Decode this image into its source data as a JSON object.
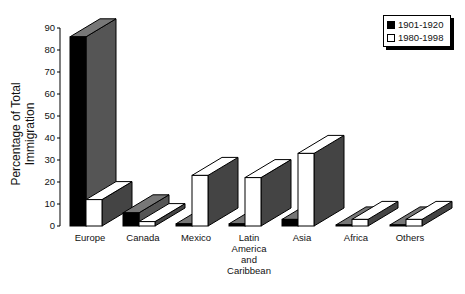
{
  "chart_data": {
    "type": "bar",
    "title": "",
    "xlabel": "",
    "ylabel": "Percentage of Total Immigration",
    "ylim": [
      0,
      90
    ],
    "yticks": [
      0,
      10,
      20,
      30,
      40,
      50,
      60,
      70,
      80,
      90
    ],
    "grid": false,
    "legend_position": "top-right",
    "style": "3d",
    "categories": [
      "Europe",
      "Canada",
      "Mexico",
      "Latin America and Caribbean",
      "Asia",
      "Africa",
      "Others"
    ],
    "series": [
      {
        "name": "1901-1920",
        "color": "#000000",
        "values": [
          86,
          6,
          1,
          1,
          3,
          0.5,
          0.5
        ]
      },
      {
        "name": "1980-1998",
        "color": "#ffffff",
        "values": [
          12,
          2,
          23,
          22,
          33,
          3,
          3
        ]
      }
    ]
  },
  "labels": {
    "ylabel": "Percentage of Total Immigration",
    "legend": [
      "1901-1920",
      "1980-1998"
    ],
    "categories": [
      "Europe",
      "Canada",
      "Mexico",
      "Latin\nAmerica\nand\nCaribbean",
      "Asia",
      "Africa",
      "Others"
    ]
  }
}
